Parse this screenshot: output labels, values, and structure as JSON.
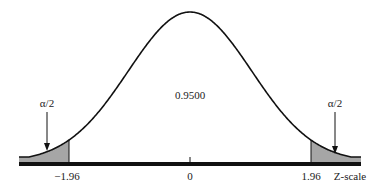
{
  "figure": {
    "center_area_label": "0.9500",
    "left_tail_label": "α/2",
    "right_tail_label": "α/2",
    "tick_labels": {
      "left_critical": "−1.96",
      "center": "0",
      "right_critical": "1.96"
    },
    "axis_label": "Z-scale",
    "colors": {
      "curve": "#111111",
      "tail_fill": "#a6a6a6",
      "axis": "#111111"
    }
  },
  "chart_data": {
    "type": "area",
    "title": "",
    "distribution": "standard normal",
    "xlabel": "Z-scale",
    "x_ticks": [
      -1.96,
      0,
      1.96
    ],
    "x_tick_labels": [
      "−1.96",
      "0",
      "1.96"
    ],
    "shaded_regions": [
      {
        "from": "-inf",
        "to": -1.96,
        "label": "α/2"
      },
      {
        "from": 1.96,
        "to": "inf",
        "label": "α/2"
      }
    ],
    "central_area": 0.95,
    "central_area_label": "0.9500",
    "grid": false,
    "legend": null
  }
}
